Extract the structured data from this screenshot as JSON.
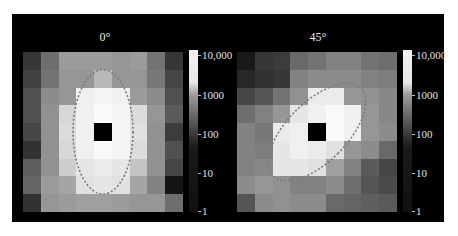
{
  "chart_data": [
    {
      "type": "heatmap",
      "title": "0°",
      "grid_size": [
        9,
        9
      ],
      "colorbar": {
        "scale": "log",
        "ticks": [
          "1",
          "10",
          "100",
          "1000",
          "10,000"
        ],
        "range": [
          1,
          10000
        ]
      },
      "gray_values": [
        [
          55,
          110,
          155,
          155,
          155,
          150,
          155,
          115,
          55
        ],
        [
          65,
          115,
          150,
          150,
          185,
          150,
          150,
          120,
          70
        ],
        [
          80,
          140,
          150,
          240,
          245,
          240,
          155,
          140,
          80
        ],
        [
          80,
          145,
          215,
          240,
          250,
          245,
          220,
          150,
          90
        ],
        [
          70,
          145,
          220,
          240,
          0,
          245,
          225,
          145,
          60
        ],
        [
          50,
          145,
          215,
          240,
          250,
          245,
          220,
          145,
          80
        ],
        [
          95,
          145,
          205,
          230,
          235,
          230,
          195,
          145,
          70
        ],
        [
          100,
          155,
          165,
          225,
          230,
          225,
          165,
          130,
          20
        ],
        [
          50,
          150,
          155,
          160,
          160,
          155,
          150,
          150,
          110
        ]
      ],
      "masked_center": [
        4,
        4
      ],
      "annotation": "dashed ellipse, vertical major axis"
    },
    {
      "type": "heatmap",
      "title": "45°",
      "grid_size": [
        9,
        9
      ],
      "colorbar": {
        "scale": "log",
        "ticks": [
          "1",
          "10",
          "100",
          "1000",
          "10,000"
        ],
        "range": [
          1,
          10000
        ]
      },
      "gray_values": [
        [
          25,
          55,
          60,
          105,
          115,
          130,
          130,
          115,
          110
        ],
        [
          40,
          50,
          55,
          130,
          140,
          140,
          140,
          130,
          125
        ],
        [
          70,
          85,
          115,
          145,
          235,
          235,
          150,
          145,
          135
        ],
        [
          110,
          130,
          150,
          230,
          240,
          250,
          240,
          150,
          135
        ],
        [
          130,
          120,
          235,
          240,
          0,
          250,
          240,
          150,
          140
        ],
        [
          130,
          125,
          230,
          240,
          235,
          225,
          150,
          140,
          105
        ],
        [
          130,
          135,
          230,
          230,
          225,
          160,
          130,
          90,
          70
        ],
        [
          140,
          150,
          145,
          130,
          130,
          140,
          110,
          85,
          75
        ],
        [
          85,
          140,
          145,
          140,
          140,
          105,
          100,
          95,
          90
        ]
      ],
      "masked_center": [
        4,
        4
      ],
      "annotation": "dashed ellipse, tilted 45°"
    }
  ],
  "panels": [
    {
      "title": "0°",
      "ticks": {
        "t10000": "10,000",
        "t1000": "1000",
        "t100": "100",
        "t10": "10",
        "t1": "1"
      }
    },
    {
      "title": "45°",
      "ticks": {
        "t10000": "10,000",
        "t1000": "1000",
        "t100": "100",
        "t10": "10",
        "t1": "1"
      }
    }
  ],
  "colors": {
    "background": "#000000",
    "ellipse": "#808080",
    "text": "#e0e0e0"
  }
}
